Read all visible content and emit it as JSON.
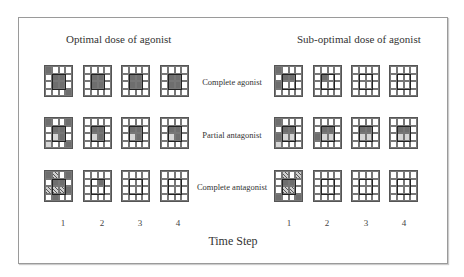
{
  "titles": {
    "optimal": "Optimal dose of agonist",
    "suboptimal": "Sub-optimal dose of agonist"
  },
  "row_labels": [
    "Complete agonist",
    "Partial antagonist",
    "Complete antagonist"
  ],
  "time_steps": [
    "1",
    "2",
    "3",
    "4"
  ],
  "axis_title": "Time Step",
  "legend_codes": {
    "d": "dark filled cell",
    "l": "light gray cell",
    "h": "hatched cell",
    "0": "empty cell"
  },
  "colors": {
    "dark": "#6e6e6e",
    "light": "#d6d6d6",
    "frame": "#9a9a9a"
  },
  "panels": {
    "optimal": [
      [
        [
          "d000",
          "0dd0",
          "0dd0",
          "000d"
        ],
        [
          "0000",
          "0dd0",
          "0dd0",
          "0000"
        ],
        [
          "0000",
          "0dd0",
          "0dd0",
          "0000"
        ],
        [
          "0000",
          "0dd0",
          "0dd0",
          "0000"
        ]
      ],
      [
        [
          "d00d",
          "0dd0",
          "0ld0",
          "l00d"
        ],
        [
          "0000",
          "0dd0",
          "0ld0",
          "0000"
        ],
        [
          "0000",
          "0dd0",
          "0ld0",
          "0000"
        ],
        [
          "0000",
          "0dd0",
          "0ld0",
          "0000"
        ]
      ],
      [
        [
          "dh0d",
          "0dd0",
          "hhhd",
          "0d00"
        ],
        [
          "0000",
          "00d0",
          "0000",
          "0000"
        ],
        [
          "0000",
          "0000",
          "0000",
          "0000"
        ],
        [
          "0000",
          "0000",
          "0000",
          "0000"
        ]
      ]
    ],
    "suboptimal": [
      [
        [
          "d000",
          "0dd0",
          "d000",
          "0000"
        ],
        [
          "0000",
          "0d00",
          "0000",
          "0000"
        ],
        [
          "0000",
          "0000",
          "0000",
          "0000"
        ],
        [
          "0000",
          "0000",
          "0000",
          "0000"
        ]
      ],
      [
        [
          "d000",
          "0dd0",
          "dll0",
          "l000"
        ],
        [
          "0000",
          "0dd0",
          "dll0",
          "0000"
        ],
        [
          "0000",
          "0dd0",
          "0ll0",
          "0000"
        ],
        [
          "0000",
          "0dd0",
          "0ll0",
          "0000"
        ]
      ],
      [
        [
          "0h0h",
          "0dd0",
          "0hh0",
          "d00d"
        ],
        [
          "0000",
          "0000",
          "0000",
          "0000"
        ],
        [
          "0000",
          "0000",
          "0000",
          "0000"
        ],
        [
          "0000",
          "0000",
          "0000",
          "0000"
        ]
      ]
    ]
  }
}
